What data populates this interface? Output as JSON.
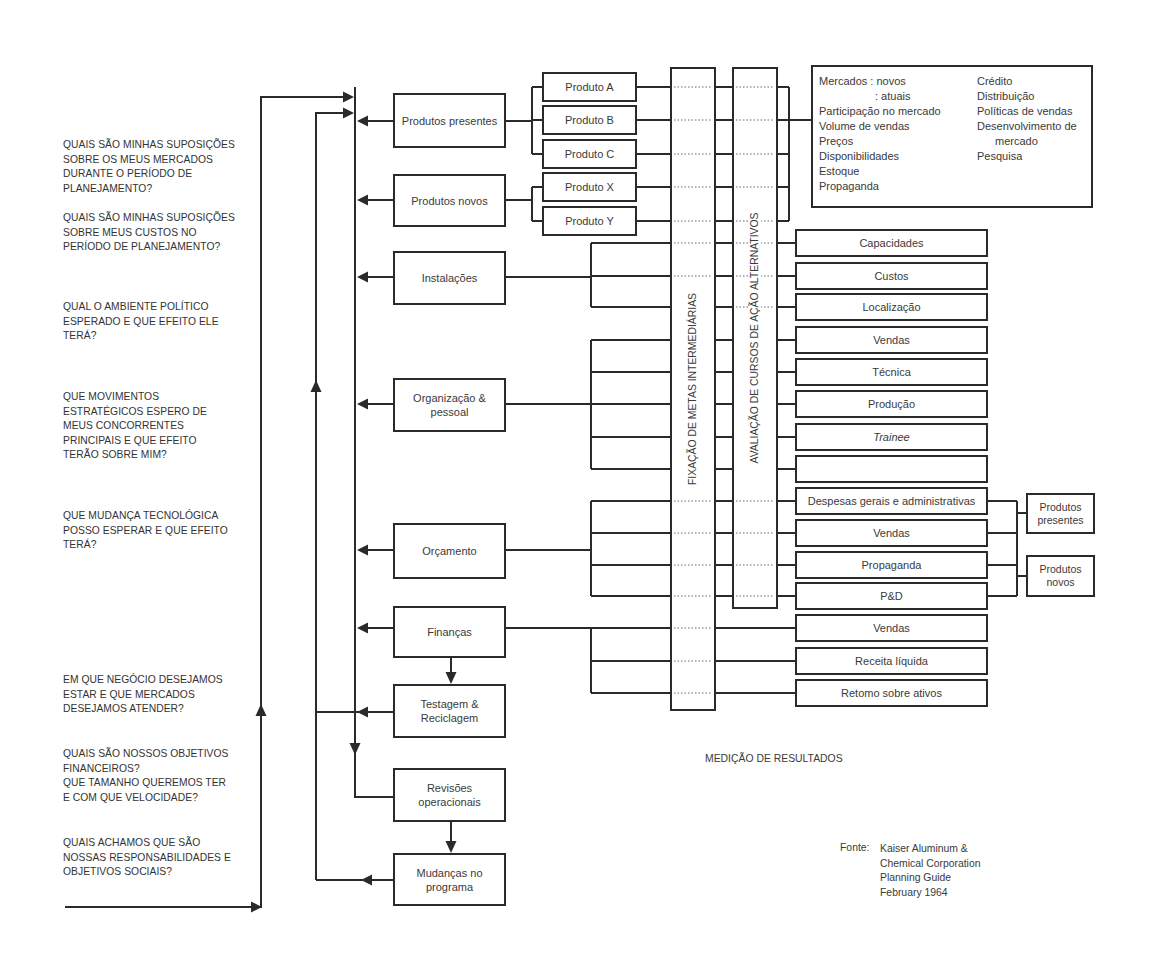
{
  "diagram": {
    "questions": [
      "QUAIS SÃO MINHAS SUPOSIÇÕES\nSOBRE OS MEUS MERCADOS\nDURANTE O PERÍODO DE\nPLANEJAMENTO?",
      "QUAIS SÃO MINHAS SUPOSIÇÕES\nSOBRE MEUS CUSTOS NO\nPERÍODO DE PLANEJAMENTO?",
      "QUAL O AMBIENTE POLÍTICO\nESPERADO E QUE EFEITO ELE\nTERÁ?",
      "QUE MOVIMENTOS\nESTRATÉGICOS ESPERO DE\nMEUS CONCORRENTES\nPRINCIPAIS E QUE EFEITO\nTERÃO SOBRE MIM?",
      "QUE MUDANÇA TECNOLÓGICA\nPOSSO ESPERAR E QUE EFEITO\nTERÁ?",
      "EM QUE NEGÓCIO DESEJAMOS\nESTAR E QUE MERCADOS\nDESEJAMOS ATENDER?",
      "QUAIS SÃO NOSSOS OBJETIVOS\nFINANCEIROS?\nQUE TAMANHO QUEREMOS TER\nE COM QUE VELOCIDADE?",
      "QUAIS ACHAMOS QUE SÃO\nNOSSAS RESPONSABILIDADES E\nOBJETIVOS SOCIAIS?"
    ],
    "left_boxes": {
      "produtos_presentes": "Produtos presentes",
      "produtos_novos": "Produtos novos",
      "instalacoes": "Instalações",
      "organizacao": "Organização &\npessoal",
      "orcamento": "Orçamento",
      "financas": "Finanças",
      "testagem": "Testagem &\nReciclagem",
      "revisoes": "Revisões\noperacionais",
      "mudancas": "Mudanças no\nprograma"
    },
    "products": [
      "Produto A",
      "Produto B",
      "Produto C",
      "Produto X",
      "Produto Y"
    ],
    "columns": {
      "fixacao": "FIXAÇÃO DE METAS INTERMEDIÁRIAS",
      "avaliacao": "AVALIAÇÃO DE CURSOS DE AÇÃO ALTERNATIVOS"
    },
    "info_box": {
      "left": [
        "Mercados  : novos",
        ": atuais",
        "Participação no mercado",
        "Volume de vendas",
        "Preços",
        "Disponibilidades",
        "Estoque",
        "Propaganda"
      ],
      "right": [
        "Crédito",
        "Distribuição",
        "Políticas de vendas",
        "Desenvolvimento de",
        "mercado",
        "Pesquisa"
      ]
    },
    "right_boxes": [
      "Capacidades",
      "Custos",
      "Localização",
      "Vendas",
      "Técnica",
      "Produção",
      "Trainee",
      "",
      "Despesas gerais e administrativas",
      "Vendas",
      "Propaganda",
      "P&D",
      "Vendas",
      "Receita líquida",
      "Retomo sobre ativos"
    ],
    "summary_boxes": [
      "Produtos\npresentes",
      "Produtos\nnovos"
    ],
    "footer": {
      "measurement": "MEDIÇÃO DE RESULTADOS",
      "source_label": "Fonte:",
      "source_lines": "Kaiser Aluminum &\nChemical Corporation\nPlanning Guide\nFebruary 1964"
    },
    "colors": {
      "line": "#2a2a2a",
      "text": "#333333",
      "background": "#ffffff"
    }
  }
}
